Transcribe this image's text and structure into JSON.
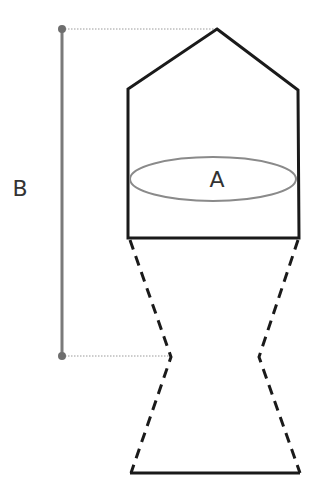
{
  "diagram": {
    "labels": {
      "A": "A",
      "B": "B"
    },
    "colors": {
      "outline": "#1a1a1a",
      "measure": "#7a7a7a",
      "ellipse": "#8a8a8a",
      "dotted": "#9a9a9a",
      "label": "#333333"
    }
  }
}
